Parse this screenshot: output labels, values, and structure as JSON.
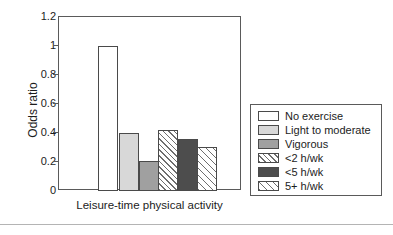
{
  "chart_data": {
    "type": "bar",
    "title": "",
    "xlabel": "Leisure-time physical activity",
    "ylabel": "Odds ratio",
    "ylim": [
      0,
      1.2
    ],
    "yticks": [
      "0",
      "0.2",
      "0.4",
      "0.6",
      "0.8",
      "1",
      "1.2"
    ],
    "grid": false,
    "legend_position": "right",
    "categories": [
      "No exercise",
      "Light to moderate",
      "Vigorous",
      "<2 h/wk",
      "<5 h/wk",
      "5+ h/wk"
    ],
    "values": [
      1.0,
      0.4,
      0.21,
      0.42,
      0.36,
      0.3
    ],
    "series": [
      {
        "name": "Odds ratio",
        "values": [
          1.0,
          0.4,
          0.21,
          0.42,
          0.36,
          0.3
        ]
      }
    ],
    "bar_styles": [
      "white",
      "light-gray",
      "medium-gray",
      "diagonal-hatch-dense",
      "dark-gray",
      "diagonal-hatch-wide"
    ]
  },
  "legend": {
    "items": [
      {
        "label": "No exercise",
        "style": "white"
      },
      {
        "label": "Light to moderate",
        "style": "light-gray"
      },
      {
        "label": "Vigorous",
        "style": "medium-gray"
      },
      {
        "label": "<2 h/wk",
        "style": "diagonal-hatch-dense"
      },
      {
        "label": "<5 h/wk",
        "style": "dark-gray"
      },
      {
        "label": "5+ h/wk",
        "style": "diagonal-hatch-wide"
      }
    ]
  },
  "colors": {
    "white": "#ffffff",
    "light_gray": "#d8d8d8",
    "medium_gray": "#a0a0a0",
    "dark_gray": "#4d4d4d",
    "hatch_line": "#6e6e6e",
    "axis": "#5a5a5a",
    "text": "#1c1c1c",
    "rule": "#b4b4b4"
  }
}
